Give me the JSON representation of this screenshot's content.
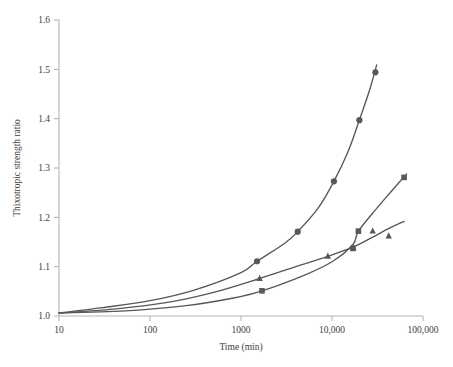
{
  "chart_data": {
    "type": "line",
    "title": "",
    "xlabel": "Time (min)",
    "ylabel": "Thixotropic strength ratio",
    "xscale": "log",
    "yscale": "linear",
    "xlim": [
      10,
      100000
    ],
    "ylim": [
      1.0,
      1.6
    ],
    "grid": false,
    "legend": "none",
    "xticks": [
      10,
      100,
      1000,
      10000,
      100000
    ],
    "xtick_labels": [
      "10",
      "100",
      "1000",
      "10,000",
      "100,000"
    ],
    "yticks": [
      1.0,
      1.1,
      1.2,
      1.3,
      1.4,
      1.5,
      1.6
    ],
    "ytick_labels": [
      "1.0",
      "1.1",
      "1.2",
      "1.3",
      "1.4",
      "1.5",
      "1.6"
    ],
    "series": [
      {
        "name": "series-circle",
        "marker": "circle",
        "color": "#595959",
        "points": [
          {
            "x": 1500,
            "y": 1.111
          },
          {
            "x": 4200,
            "y": 1.171
          },
          {
            "x": 10500,
            "y": 1.273
          },
          {
            "x": 20000,
            "y": 1.397
          },
          {
            "x": 30000,
            "y": 1.494
          }
        ],
        "curve": [
          {
            "x": 10,
            "y": 1.006
          },
          {
            "x": 30,
            "y": 1.017
          },
          {
            "x": 100,
            "y": 1.031
          },
          {
            "x": 300,
            "y": 1.052
          },
          {
            "x": 1000,
            "y": 1.088
          },
          {
            "x": 1500,
            "y": 1.111
          },
          {
            "x": 3000,
            "y": 1.147
          },
          {
            "x": 4200,
            "y": 1.171
          },
          {
            "x": 7000,
            "y": 1.218
          },
          {
            "x": 10500,
            "y": 1.273
          },
          {
            "x": 15000,
            "y": 1.333
          },
          {
            "x": 20000,
            "y": 1.397
          },
          {
            "x": 26000,
            "y": 1.459
          },
          {
            "x": 31000,
            "y": 1.509
          }
        ]
      },
      {
        "name": "series-triangle",
        "marker": "triangle",
        "color": "#595959",
        "points": [
          {
            "x": 1600,
            "y": 1.076
          },
          {
            "x": 9000,
            "y": 1.121
          },
          {
            "x": 17200,
            "y": 1.138
          },
          {
            "x": 28000,
            "y": 1.172
          },
          {
            "x": 42000,
            "y": 1.162
          }
        ],
        "curve": [
          {
            "x": 10,
            "y": 1.006
          },
          {
            "x": 40,
            "y": 1.014
          },
          {
            "x": 150,
            "y": 1.027
          },
          {
            "x": 500,
            "y": 1.048
          },
          {
            "x": 1600,
            "y": 1.076
          },
          {
            "x": 4000,
            "y": 1.1
          },
          {
            "x": 9000,
            "y": 1.121
          },
          {
            "x": 17200,
            "y": 1.14
          },
          {
            "x": 28000,
            "y": 1.16
          },
          {
            "x": 45000,
            "y": 1.18
          },
          {
            "x": 62000,
            "y": 1.192
          }
        ]
      },
      {
        "name": "series-square",
        "marker": "square",
        "color": "#595959",
        "points": [
          {
            "x": 1700,
            "y": 1.051
          },
          {
            "x": 17000,
            "y": 1.137
          },
          {
            "x": 19500,
            "y": 1.172
          },
          {
            "x": 62000,
            "y": 1.281
          }
        ],
        "curve": [
          {
            "x": 10,
            "y": 1.006
          },
          {
            "x": 60,
            "y": 1.011
          },
          {
            "x": 250,
            "y": 1.021
          },
          {
            "x": 800,
            "y": 1.036
          },
          {
            "x": 1700,
            "y": 1.051
          },
          {
            "x": 5000,
            "y": 1.083
          },
          {
            "x": 10000,
            "y": 1.11
          },
          {
            "x": 17000,
            "y": 1.145
          },
          {
            "x": 19500,
            "y": 1.172
          },
          {
            "x": 30000,
            "y": 1.215
          },
          {
            "x": 45000,
            "y": 1.253
          },
          {
            "x": 66000,
            "y": 1.288
          }
        ]
      }
    ]
  },
  "axis": {
    "x_title": "Time (min)",
    "y_title": "Thixotropic strength ratio"
  }
}
